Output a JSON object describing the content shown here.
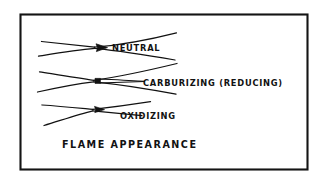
{
  "figure": {
    "caption": "FLAME APPEARANCE",
    "border_color": "#141414",
    "ink_color": "#111111",
    "paper_color": "#ffffff",
    "medium": "hand-drawn ink line diagram"
  },
  "flames": [
    {
      "id": "neutral",
      "label": "NEUTRAL",
      "label_x": 112,
      "label_y": 51,
      "inner_cone": "short rounded filled cone",
      "envelope": "long symmetric envelope flaring to the right"
    },
    {
      "id": "carburizing",
      "label": "CARBURIZING (REDUCING)",
      "label_x": 143,
      "label_y": 86,
      "inner_cone": "small square cone with long feathery acetylene streamer",
      "envelope": "long symmetric envelope flaring to the right"
    },
    {
      "id": "oxidizing",
      "label": "OXIDIZING",
      "label_x": 120,
      "label_y": 119,
      "inner_cone": "short sharp pointed filled cone",
      "envelope": "short narrow envelope"
    }
  ]
}
